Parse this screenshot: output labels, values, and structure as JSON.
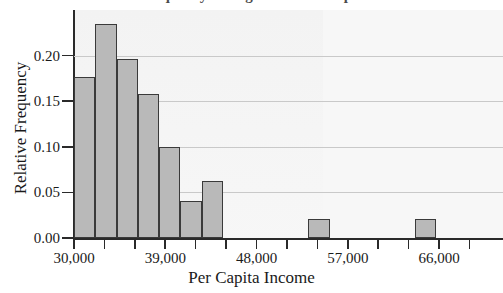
{
  "figure": {
    "title_partial": "Relative Frequency Histogram of Per Capita Income",
    "background": "#ffffff",
    "plot_background": "#f4f4f4",
    "bar_fill": "#b9b9b9",
    "bar_edge": "#3a3a3a",
    "gridline_color": "#c9c9c9",
    "axis_color": "#2a2a2a"
  },
  "chart_data": {
    "type": "bar",
    "title": "Relative Frequency Histogram of Per Capita Income",
    "xlabel": "Per Capita Income",
    "ylabel": "Relative Frequency",
    "xlim": [
      30000,
      72300
    ],
    "ylim": [
      0.0,
      0.25
    ],
    "grid": true,
    "legend": "none",
    "bin_width": 2100,
    "bin_edges": [
      30000,
      32100,
      34200,
      36300,
      38400,
      40500,
      42600,
      44700,
      46800,
      48900,
      51000,
      53100,
      55200,
      57300,
      59400,
      61500,
      63600,
      65700,
      67800
    ],
    "categories": [
      "30,000-32,100",
      "32,100-34,200",
      "34,200-36,300",
      "36,300-38,400",
      "38,400-40,500",
      "40,500-42,600",
      "42,600-44,700",
      "44,700-46,800",
      "53,100-55,200",
      "63,600-65,700"
    ],
    "values": [
      0.177,
      0.235,
      0.196,
      0.158,
      0.1,
      0.041,
      0.062,
      0.0,
      0.021,
      0.021
    ],
    "bars": [
      {
        "x0": 30000,
        "x1": 32100,
        "value": 0.177
      },
      {
        "x0": 32100,
        "x1": 34200,
        "value": 0.235
      },
      {
        "x0": 34200,
        "x1": 36300,
        "value": 0.196
      },
      {
        "x0": 36300,
        "x1": 38400,
        "value": 0.158
      },
      {
        "x0": 38400,
        "x1": 40500,
        "value": 0.1
      },
      {
        "x0": 40500,
        "x1": 42600,
        "value": 0.041
      },
      {
        "x0": 42600,
        "x1": 44700,
        "value": 0.062
      },
      {
        "x0": 53100,
        "x1": 55200,
        "value": 0.021
      },
      {
        "x0": 63600,
        "x1": 65700,
        "value": 0.021
      }
    ],
    "y_ticks": [
      "0.00",
      "0.05",
      "0.10",
      "0.15",
      "0.20"
    ],
    "y_tick_values": [
      0.0,
      0.05,
      0.1,
      0.15,
      0.2
    ],
    "x_ticks_labeled": [
      "30,000",
      "39,000",
      "48,000",
      "57,000",
      "66,000"
    ],
    "x_tick_values_labeled": [
      30000,
      39000,
      48000,
      57000,
      66000
    ],
    "x_tick_values_all": [
      30000,
      33000,
      36000,
      39000,
      42000,
      45000,
      48000,
      51000,
      54000,
      57000,
      60000,
      63000,
      66000,
      69000
    ]
  }
}
